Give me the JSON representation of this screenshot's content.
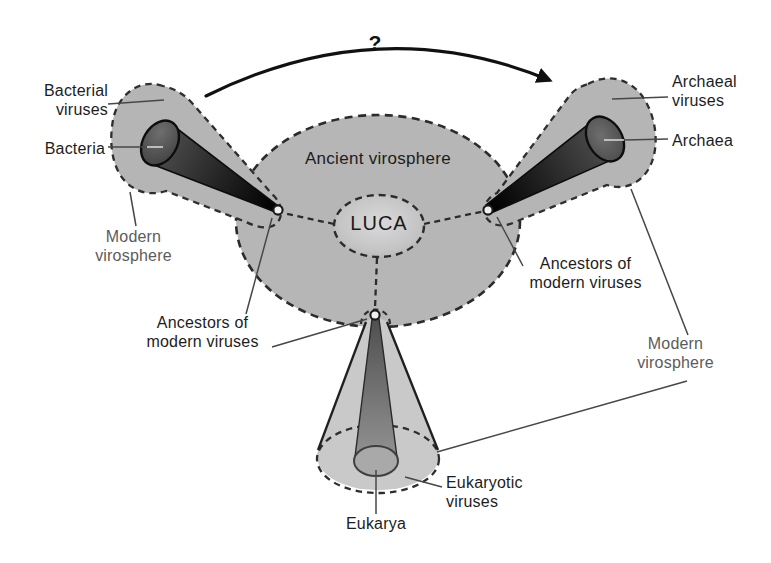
{
  "heading": {
    "clipped_text": "Where do viruses come from?"
  },
  "diagram": {
    "question_mark": "?",
    "center": {
      "ancient_virosphere_label": "Ancient virosphere",
      "luca_label": "LUCA"
    },
    "bacteria_branch": {
      "viruses_label": "Bacterial\nviruses",
      "organism_label": "Bacteria",
      "modern_virosphere_label": "Modern\nvirosphere",
      "ancestors_label": "Ancestors of\nmodern viruses"
    },
    "archaea_branch": {
      "viruses_label": "Archaeal\nviruses",
      "organism_label": "Archaea",
      "modern_virosphere_label": "Modern\nvirosphere",
      "ancestors_label": "Ancestors of\nmodern viruses"
    },
    "eukarya_branch": {
      "viruses_label": "Eukaryotic\nviruses",
      "organism_label": "Eukarya"
    },
    "colors": {
      "background": "#ffffff",
      "virosphere_gray": "#b5b5b5",
      "eukaryote_envelope_gray": "#c9c9c9",
      "luca_center": "#d8d8d8",
      "cone_dark": "#0a0a0a",
      "cone_face_dark": "#4f4f4f",
      "eukarya_cone_face": "#a9a9a9",
      "label_dark": "#1d1d1d",
      "label_gray": "#5c5c5c",
      "outline_dark": "#222222"
    }
  }
}
